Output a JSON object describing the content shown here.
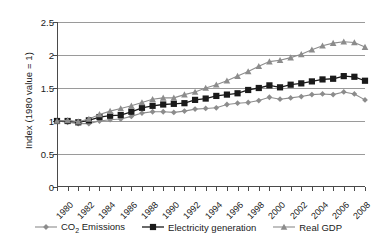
{
  "chart_data": {
    "type": "line",
    "title": "",
    "xlabel": "",
    "ylabel": "Index (1980 value = 1)",
    "ylim": [
      0,
      2.5
    ],
    "xlim": [
      1980,
      2009
    ],
    "ytick_labels": [
      "0",
      "0.5",
      "1",
      "1.5",
      "2",
      "2.5"
    ],
    "ytick_values": [
      0,
      0.5,
      1,
      1.5,
      2,
      2.5
    ],
    "xtick_labels": [
      "1980",
      "1982",
      "1984",
      "1986",
      "1988",
      "1990",
      "1992",
      "1994",
      "1996",
      "1998",
      "2000",
      "2002",
      "2004",
      "2006",
      "2008"
    ],
    "xtick_values": [
      1980,
      1982,
      1984,
      1986,
      1988,
      1990,
      1992,
      1994,
      1996,
      1998,
      2000,
      2002,
      2004,
      2006,
      2008
    ],
    "grid": "horizontal",
    "legend_position": "bottom",
    "x": [
      1980,
      1981,
      1982,
      1983,
      1984,
      1985,
      1986,
      1987,
      1988,
      1989,
      1990,
      1991,
      1992,
      1993,
      1994,
      1995,
      1996,
      1997,
      1998,
      1999,
      2000,
      2001,
      2002,
      2003,
      2004,
      2005,
      2006,
      2007,
      2008,
      2009
    ],
    "series": [
      {
        "name": "CO2 Emissions",
        "name_html": "CO<sub>2</sub> Emissions",
        "marker": "diamond",
        "color": "#8c8c8c",
        "values": [
          1.0,
          0.98,
          0.96,
          0.96,
          1.0,
          1.02,
          1.03,
          1.07,
          1.12,
          1.14,
          1.14,
          1.13,
          1.15,
          1.18,
          1.19,
          1.2,
          1.25,
          1.27,
          1.28,
          1.31,
          1.36,
          1.33,
          1.35,
          1.37,
          1.4,
          1.41,
          1.4,
          1.44,
          1.41,
          1.32
        ]
      },
      {
        "name": "Electricity generation",
        "name_html": "Electricity generation",
        "marker": "square",
        "color": "#1a1a1a",
        "values": [
          1.0,
          1.0,
          0.98,
          1.01,
          1.06,
          1.08,
          1.09,
          1.14,
          1.2,
          1.23,
          1.25,
          1.26,
          1.27,
          1.32,
          1.34,
          1.38,
          1.4,
          1.42,
          1.47,
          1.5,
          1.54,
          1.51,
          1.55,
          1.57,
          1.6,
          1.63,
          1.64,
          1.68,
          1.67,
          1.61
        ]
      },
      {
        "name": "Real GDP",
        "name_html": "Real GDP",
        "marker": "triangle",
        "color": "#8c8c8c",
        "values": [
          1.0,
          1.01,
          0.99,
          1.03,
          1.1,
          1.15,
          1.19,
          1.23,
          1.28,
          1.33,
          1.35,
          1.35,
          1.4,
          1.44,
          1.5,
          1.55,
          1.61,
          1.68,
          1.75,
          1.83,
          1.9,
          1.92,
          1.96,
          2.01,
          2.08,
          2.14,
          2.18,
          2.2,
          2.19,
          2.12
        ]
      }
    ]
  },
  "legend": {
    "items": [
      {
        "label": "CO2 Emissions",
        "label_html": "CO<sub>2</sub> Emissions"
      },
      {
        "label": "Electricity generation",
        "label_html": "Electricity generation"
      },
      {
        "label": "Real GDP",
        "label_html": "Real GDP"
      }
    ]
  },
  "colors": {
    "gray_series": "#8c8c8c",
    "black_series": "#1a1a1a",
    "gridline": "#9a9a9a",
    "axis": "#4a4a4a",
    "background": "#ffffff"
  }
}
